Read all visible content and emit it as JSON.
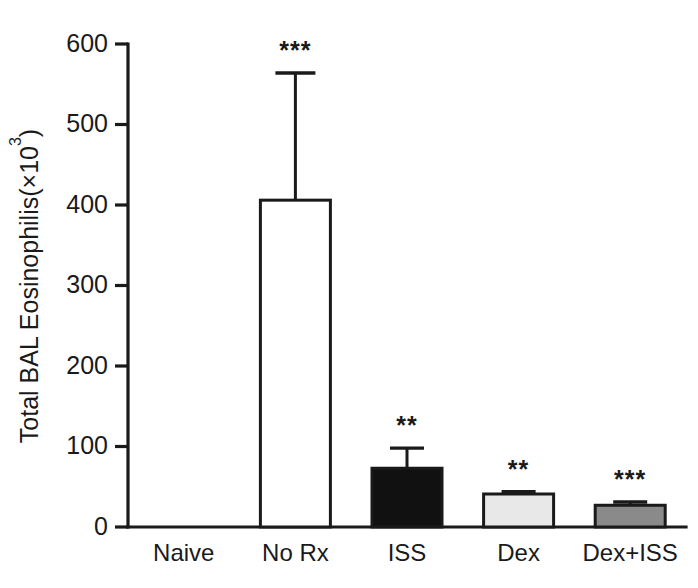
{
  "chart_data": {
    "type": "bar",
    "title": "",
    "xlabel": "",
    "ylabel": "Total BAL Eosinophilis(×10³)",
    "ylabel_base": "Total BAL Eosinophilis(×10",
    "ylabel_exponent": "3",
    "ylabel_tail": ")",
    "categories": [
      "Naive",
      "No Rx",
      "ISS",
      "Dex",
      "Dex+ISS"
    ],
    "values": [
      0,
      406,
      73,
      41,
      27
    ],
    "errors": [
      0,
      158,
      25,
      3,
      4
    ],
    "significance": [
      "",
      "***",
      "**",
      "**",
      "***"
    ],
    "bar_fills": [
      "#ffffff",
      "#ffffff",
      "#111111",
      "#e8e8e8",
      "#8a8a8a"
    ],
    "bar_fill_names": [
      "white",
      "white",
      "black",
      "light-gray",
      "medium-gray"
    ],
    "ylim": [
      0,
      600
    ],
    "yticks": [
      0,
      100,
      200,
      300,
      400,
      500,
      600
    ],
    "ytick_labels": [
      "0",
      "100",
      "200",
      "300",
      "400",
      "500",
      "600"
    ],
    "grid": false,
    "legend": "none",
    "axis_color": "#1a1a1a"
  }
}
